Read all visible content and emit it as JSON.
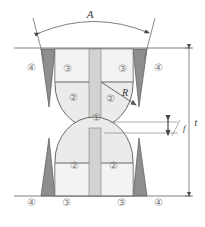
{
  "figure": {
    "type": "engineering-diagram",
    "background": "#ffffff",
    "dimensions": {
      "width": 205,
      "height": 227
    }
  },
  "labels": {
    "arc_width": "A",
    "radius": "R",
    "gap": "f",
    "thickness": "t"
  },
  "zones": [
    {
      "id": "1",
      "glyph": "①",
      "name": "zone-1-center-core",
      "x": 96,
      "y": 118
    },
    {
      "id": "2",
      "glyph": "②",
      "name": "zone-2-upper-left",
      "x": 73,
      "y": 97
    },
    {
      "id": "2",
      "glyph": "②",
      "name": "zone-2-upper-right",
      "x": 105,
      "y": 99
    },
    {
      "id": "2",
      "glyph": "②",
      "name": "zone-2-lower-left",
      "x": 74,
      "y": 166
    },
    {
      "id": "2",
      "glyph": "②",
      "name": "zone-2-lower-right",
      "x": 111,
      "y": 166
    },
    {
      "id": "3",
      "glyph": "③",
      "name": "zone-3-upper-left",
      "x": 66,
      "y": 69
    },
    {
      "id": "3",
      "glyph": "③",
      "name": "zone-3-upper-right",
      "x": 121,
      "y": 69
    },
    {
      "id": "3",
      "glyph": "③",
      "name": "zone-3-lower-left",
      "x": 65,
      "y": 202
    },
    {
      "id": "3",
      "glyph": "③",
      "name": "zone-3-lower-right",
      "x": 120,
      "y": 202
    },
    {
      "id": "4",
      "glyph": "④",
      "name": "zone-4-upper-left",
      "x": 30,
      "y": 68
    },
    {
      "id": "4",
      "glyph": "④",
      "name": "zone-4-upper-right",
      "x": 157,
      "y": 68
    },
    {
      "id": "4",
      "glyph": "④",
      "name": "zone-4-lower-left",
      "x": 30,
      "y": 203
    },
    {
      "id": "4",
      "glyph": "④",
      "name": "zone-4-lower-right",
      "x": 157,
      "y": 203
    }
  ],
  "colors": {
    "outline": "#5a5a5a",
    "thin_line": "#9a9a9a",
    "fill_light": "#f1f1f1",
    "fill_mid": "#e4e4e4",
    "fill_column": "#d2d2d2",
    "fill_dark": "#8e8e8e",
    "label_gray": "#7d7d7d",
    "text_dark": "#3a3a3a"
  }
}
